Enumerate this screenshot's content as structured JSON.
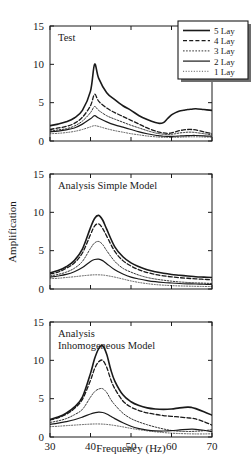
{
  "figure": {
    "ylabel": "Amplification",
    "xlabel": "Frequency (Hz)"
  },
  "legend": {
    "items": [
      {
        "label": "5 Lay",
        "style": "thick-solid"
      },
      {
        "label": "4 Lay",
        "style": "dashed"
      },
      {
        "label": "3 Lay",
        "style": "dotted"
      },
      {
        "label": "2 Lay",
        "style": "solid"
      },
      {
        "label": "1 Lay",
        "style": "fine-dotted"
      }
    ]
  },
  "chart_data": [
    {
      "type": "line",
      "title": "Test",
      "xlabel": "Frequency (Hz)",
      "ylabel": "Amplification",
      "xlim": [
        30,
        70
      ],
      "ylim": [
        0,
        15
      ],
      "xticks": [
        30,
        40,
        50,
        60,
        70
      ],
      "yticks": [
        0,
        5,
        10,
        15
      ],
      "grid": false,
      "legend_position": "top-right",
      "x": [
        30,
        32,
        34,
        36,
        38,
        40,
        41,
        42,
        44,
        46,
        48,
        50,
        52,
        54,
        56,
        57,
        58,
        59,
        60,
        61,
        62,
        63,
        64,
        65,
        66,
        68,
        70
      ],
      "series": [
        {
          "name": "5 Lay",
          "style": "thick-solid",
          "values": [
            2.0,
            2.2,
            2.5,
            3.0,
            4.0,
            6.5,
            10.0,
            8.2,
            6.3,
            5.4,
            4.6,
            4.0,
            3.3,
            2.8,
            2.4,
            2.3,
            2.4,
            2.9,
            3.4,
            3.7,
            3.9,
            4.0,
            4.1,
            4.15,
            4.2,
            4.1,
            4.0
          ]
        },
        {
          "name": "4 Lay",
          "style": "dashed",
          "values": [
            1.5,
            1.7,
            1.9,
            2.3,
            3.1,
            4.6,
            6.1,
            5.2,
            4.3,
            3.7,
            3.2,
            2.7,
            2.2,
            1.7,
            1.3,
            1.15,
            1.05,
            1.0,
            1.05,
            1.2,
            1.35,
            1.45,
            1.5,
            1.5,
            1.45,
            1.2,
            0.95
          ]
        },
        {
          "name": "3 Lay",
          "style": "dotted",
          "values": [
            1.3,
            1.45,
            1.6,
            1.95,
            2.6,
            3.7,
            4.5,
            4.0,
            3.3,
            2.85,
            2.45,
            2.05,
            1.7,
            1.35,
            1.05,
            0.95,
            0.88,
            0.85,
            0.88,
            0.95,
            1.05,
            1.1,
            1.15,
            1.15,
            1.1,
            0.95,
            0.8
          ]
        },
        {
          "name": "2 Lay",
          "style": "solid",
          "values": [
            1.2,
            1.3,
            1.45,
            1.7,
            2.2,
            2.9,
            3.3,
            3.0,
            2.5,
            2.1,
            1.8,
            1.5,
            1.2,
            0.95,
            0.75,
            0.68,
            0.62,
            0.6,
            0.6,
            0.62,
            0.65,
            0.68,
            0.7,
            0.72,
            0.72,
            0.68,
            0.62
          ]
        },
        {
          "name": "1 Lay",
          "style": "fine-dotted",
          "values": [
            0.95,
            1.0,
            1.1,
            1.25,
            1.5,
            1.85,
            2.0,
            1.9,
            1.6,
            1.35,
            1.15,
            0.95,
            0.8,
            0.65,
            0.55,
            0.5,
            0.48,
            0.46,
            0.46,
            0.48,
            0.5,
            0.52,
            0.54,
            0.55,
            0.55,
            0.52,
            0.48
          ]
        }
      ]
    },
    {
      "type": "line",
      "title": "Analysis Simple Model",
      "xlabel": "Frequency (Hz)",
      "ylabel": "Amplification",
      "xlim": [
        30,
        70
      ],
      "ylim": [
        0,
        15
      ],
      "xticks": [
        30,
        40,
        50,
        60,
        70
      ],
      "yticks": [
        0,
        5,
        10,
        15
      ],
      "grid": false,
      "x": [
        30,
        32,
        34,
        36,
        38,
        40,
        41,
        42,
        43,
        44,
        46,
        48,
        50,
        52,
        54,
        56,
        58,
        60,
        62,
        64,
        66,
        68,
        70
      ],
      "series": [
        {
          "name": "5 Lay",
          "style": "thick-solid",
          "values": [
            2.1,
            2.4,
            2.9,
            3.7,
            5.2,
            8.0,
            9.2,
            9.6,
            9.0,
            7.8,
            5.5,
            4.2,
            3.4,
            2.9,
            2.5,
            2.25,
            2.05,
            1.9,
            1.8,
            1.7,
            1.6,
            1.55,
            1.5
          ]
        },
        {
          "name": "4 Lay",
          "style": "dashed",
          "values": [
            1.95,
            2.2,
            2.7,
            3.4,
            4.7,
            7.1,
            8.2,
            8.5,
            7.9,
            6.9,
            4.9,
            3.7,
            3.0,
            2.5,
            2.15,
            1.9,
            1.72,
            1.58,
            1.48,
            1.4,
            1.32,
            1.26,
            1.2
          ]
        },
        {
          "name": "3 Lay",
          "style": "dotted",
          "values": [
            1.7,
            1.9,
            2.2,
            2.7,
            3.6,
            5.3,
            6.0,
            6.2,
            5.8,
            5.0,
            3.6,
            2.7,
            2.2,
            1.8,
            1.5,
            1.3,
            1.15,
            1.02,
            0.92,
            0.85,
            0.8,
            0.76,
            0.72
          ]
        },
        {
          "name": "2 Lay",
          "style": "solid",
          "values": [
            1.55,
            1.7,
            1.9,
            2.25,
            2.8,
            3.6,
            3.85,
            3.9,
            3.7,
            3.3,
            2.5,
            1.95,
            1.55,
            1.3,
            1.1,
            0.95,
            0.85,
            0.78,
            0.72,
            0.68,
            0.65,
            0.62,
            0.6
          ]
        },
        {
          "name": "1 Lay",
          "style": "fine-dotted",
          "values": [
            1.35,
            1.4,
            1.5,
            1.6,
            1.72,
            1.82,
            1.85,
            1.85,
            1.82,
            1.75,
            1.55,
            1.3,
            1.05,
            0.85,
            0.7,
            0.58,
            0.5,
            0.44,
            0.4,
            0.37,
            0.35,
            0.33,
            0.32
          ]
        }
      ]
    },
    {
      "type": "line",
      "title": "Analysis Inhomogeneous Model",
      "title_lines": [
        "Analysis",
        "Inhomogeneous Model"
      ],
      "xlabel": "Frequency (Hz)",
      "ylabel": "Amplification",
      "xlim": [
        30,
        70
      ],
      "ylim": [
        0,
        15
      ],
      "xticks": [
        30,
        40,
        50,
        60,
        70
      ],
      "yticks": [
        0,
        5,
        10,
        15
      ],
      "grid": false,
      "x": [
        30,
        32,
        34,
        36,
        38,
        40,
        41,
        42,
        43,
        44,
        45,
        46,
        48,
        50,
        52,
        54,
        56,
        58,
        60,
        62,
        64,
        65,
        66,
        68,
        70
      ],
      "series": [
        {
          "name": "5 Lay",
          "style": "thick-solid",
          "values": [
            2.3,
            2.6,
            3.1,
            3.9,
            5.2,
            8.3,
            10.2,
            11.5,
            11.9,
            10.8,
            8.8,
            7.3,
            5.5,
            4.6,
            4.1,
            3.8,
            3.65,
            3.6,
            3.65,
            3.8,
            3.9,
            3.85,
            3.7,
            3.3,
            2.85
          ]
        },
        {
          "name": "4 Lay",
          "style": "dashed",
          "values": [
            2.2,
            2.5,
            2.95,
            3.7,
            4.9,
            7.4,
            8.9,
            9.8,
            10.0,
            9.1,
            7.5,
            6.3,
            4.7,
            3.9,
            3.45,
            3.15,
            2.95,
            2.8,
            2.7,
            2.6,
            2.5,
            2.45,
            2.35,
            2.0,
            1.55
          ]
        },
        {
          "name": "3 Lay",
          "style": "dotted",
          "values": [
            1.9,
            2.1,
            2.4,
            2.9,
            3.6,
            5.2,
            5.9,
            6.25,
            6.3,
            5.8,
            4.9,
            4.2,
            3.1,
            2.4,
            1.95,
            1.6,
            1.3,
            1.05,
            0.85,
            0.75,
            0.72,
            0.73,
            0.75,
            0.82,
            0.95
          ]
        },
        {
          "name": "2 Lay",
          "style": "solid",
          "values": [
            1.65,
            1.8,
            2.0,
            2.25,
            2.6,
            3.0,
            3.15,
            3.25,
            3.2,
            3.0,
            2.7,
            2.4,
            1.85,
            1.4,
            1.1,
            0.9,
            0.8,
            0.78,
            0.82,
            0.92,
            1.0,
            1.02,
            1.0,
            0.88,
            0.7
          ]
        },
        {
          "name": "1 Lay",
          "style": "fine-dotted",
          "values": [
            1.35,
            1.4,
            1.48,
            1.55,
            1.62,
            1.68,
            1.7,
            1.7,
            1.68,
            1.64,
            1.58,
            1.5,
            1.32,
            1.12,
            0.95,
            0.8,
            0.68,
            0.58,
            0.5,
            0.45,
            0.42,
            0.41,
            0.4,
            0.4,
            0.42
          ]
        }
      ]
    }
  ]
}
